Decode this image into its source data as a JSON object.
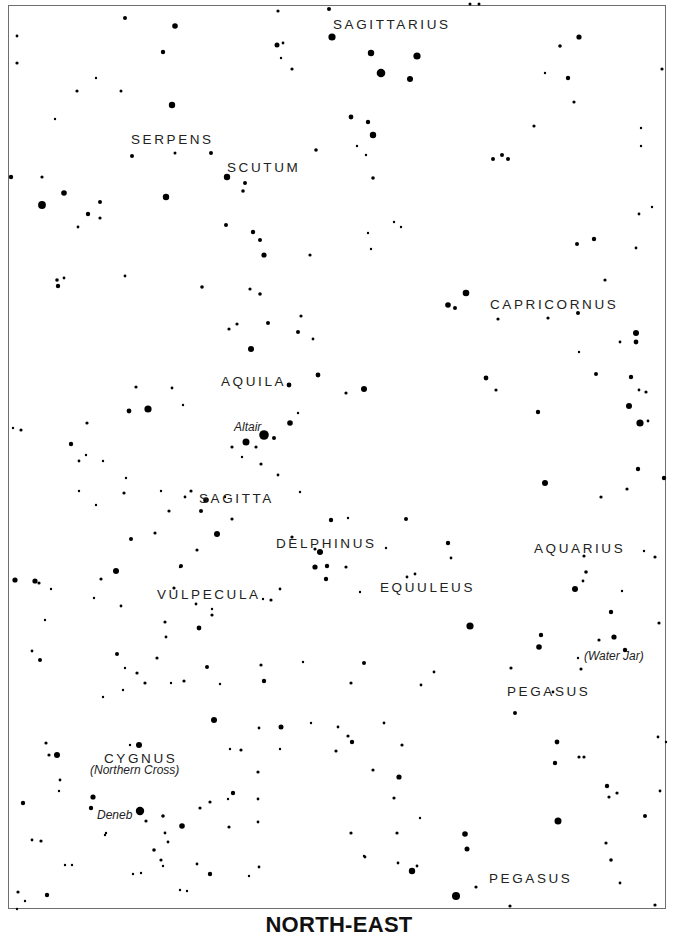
{
  "map": {
    "title": "NORTH-EAST",
    "frame": {
      "x": 8,
      "y": 5,
      "w": 658,
      "h": 904,
      "color": "#6e6e6e"
    },
    "colors": {
      "star": "#000000",
      "label": "#222222",
      "background": "#ffffff"
    },
    "constellation_labels": [
      {
        "text": "SAGITTARIUS",
        "x": 333,
        "y": 29
      },
      {
        "text": "SERPENS",
        "x": 131,
        "y": 144
      },
      {
        "text": "SCUTUM",
        "x": 227,
        "y": 172
      },
      {
        "text": "CAPRICORNUS",
        "x": 490,
        "y": 309
      },
      {
        "text": "AQUILA",
        "x": 221,
        "y": 386
      },
      {
        "text": "SAGITTA",
        "x": 199,
        "y": 503
      },
      {
        "text": "DELPHINUS",
        "x": 276,
        "y": 548
      },
      {
        "text": "AQUARIUS",
        "x": 534,
        "y": 553
      },
      {
        "text": "VULPECULA",
        "x": 157,
        "y": 599
      },
      {
        "text": "EQUULEUS",
        "x": 380,
        "y": 592
      },
      {
        "text": "PEGASUS",
        "x": 507,
        "y": 696
      },
      {
        "text": "CYGNUS",
        "x": 104,
        "y": 763
      },
      {
        "text": "PEGASUS",
        "x": 489,
        "y": 883
      }
    ],
    "star_labels": [
      {
        "text": "Altair",
        "x": 234,
        "y": 431
      },
      {
        "text": "(Water Jar)",
        "x": 584,
        "y": 660
      },
      {
        "text": "(Northern Cross)",
        "x": 90,
        "y": 774
      },
      {
        "text": "Deneb",
        "x": 97,
        "y": 819
      }
    ],
    "stars": [
      [
        332,
        37,
        3.6
      ],
      [
        371,
        53,
        3.2
      ],
      [
        417,
        56,
        3.6
      ],
      [
        381,
        73,
        4.3
      ],
      [
        410,
        79,
        3.0
      ],
      [
        351,
        117,
        2.4
      ],
      [
        368,
        122,
        2.2
      ],
      [
        373,
        135,
        3.2
      ],
      [
        366,
        155,
        1.2
      ],
      [
        373,
        178,
        1.8
      ],
      [
        357,
        146,
        1.2
      ],
      [
        125,
        18,
        2.0
      ],
      [
        175,
        26,
        2.8
      ],
      [
        163,
        52,
        2.2
      ],
      [
        172,
        105,
        3.2
      ],
      [
        121,
        91,
        1.5
      ],
      [
        17,
        63,
        1.6
      ],
      [
        17,
        36,
        1.4
      ],
      [
        77,
        91,
        1.6
      ],
      [
        96,
        78,
        1.2
      ],
      [
        55,
        119,
        1.2
      ],
      [
        42,
        177,
        1.6
      ],
      [
        11,
        177,
        2.2
      ],
      [
        42,
        205,
        3.9
      ],
      [
        64,
        193,
        2.8
      ],
      [
        88,
        214,
        2.2
      ],
      [
        100,
        202,
        2.0
      ],
      [
        100,
        218,
        1.6
      ],
      [
        78,
        227,
        1.4
      ],
      [
        166,
        197,
        3.2
      ],
      [
        175,
        153,
        1.5
      ],
      [
        132,
        156,
        2.0
      ],
      [
        211,
        153,
        2.0
      ],
      [
        227,
        177,
        3.2
      ],
      [
        245,
        183,
        2.0
      ],
      [
        243,
        191,
        1.8
      ],
      [
        226,
        225,
        2.0
      ],
      [
        253,
        232,
        2.2
      ],
      [
        260,
        240,
        2.0
      ],
      [
        264,
        255,
        2.6
      ],
      [
        278,
        11,
        1.6
      ],
      [
        292,
        69,
        1.6
      ],
      [
        277,
        45,
        2.5
      ],
      [
        283,
        43,
        1.4
      ],
      [
        281,
        58,
        1.2
      ],
      [
        316,
        150,
        1.8
      ],
      [
        329,
        9,
        2.0
      ],
      [
        470,
        4,
        1.5
      ],
      [
        479,
        4,
        1.5
      ],
      [
        579,
        37,
        2.6
      ],
      [
        560,
        46,
        1.8
      ],
      [
        568,
        78,
        2.2
      ],
      [
        574,
        102,
        1.6
      ],
      [
        545,
        73,
        1.2
      ],
      [
        502,
        155,
        2.0
      ],
      [
        493,
        159,
        2.0
      ],
      [
        508,
        159,
        2.0
      ],
      [
        534,
        126,
        1.6
      ],
      [
        662,
        69,
        1.6
      ],
      [
        641,
        128,
        1.2
      ],
      [
        641,
        146,
        1.2
      ],
      [
        394,
        222,
        1.2
      ],
      [
        401,
        227,
        1.2
      ],
      [
        368,
        233,
        1.2
      ],
      [
        371,
        249,
        1.2
      ],
      [
        577,
        244,
        2.0
      ],
      [
        594,
        239,
        2.2
      ],
      [
        639,
        214,
        1.4
      ],
      [
        652,
        207,
        1.2
      ],
      [
        636,
        248,
        1.4
      ],
      [
        466,
        293,
        3.3
      ],
      [
        448,
        305,
        2.8
      ],
      [
        455,
        308,
        2.0
      ],
      [
        498,
        319,
        1.6
      ],
      [
        548,
        318,
        1.6
      ],
      [
        578,
        313,
        2.0
      ],
      [
        605,
        280,
        1.6
      ],
      [
        636,
        333,
        3.0
      ],
      [
        636,
        342,
        2.4
      ],
      [
        620,
        342,
        1.4
      ],
      [
        579,
        352,
        1.2
      ],
      [
        486,
        378,
        2.4
      ],
      [
        496,
        390,
        1.6
      ],
      [
        538,
        412,
        2.2
      ],
      [
        596,
        374,
        2.0
      ],
      [
        631,
        377,
        2.2
      ],
      [
        639,
        390,
        1.4
      ],
      [
        629,
        406,
        3.0
      ],
      [
        640,
        423,
        3.6
      ],
      [
        646,
        392,
        1.6
      ],
      [
        648,
        421,
        1.4
      ],
      [
        545,
        483,
        3.0
      ],
      [
        638,
        469,
        2.2
      ],
      [
        627,
        489,
        1.6
      ],
      [
        664,
        478,
        2.2
      ],
      [
        364,
        389,
        3.0
      ],
      [
        346,
        393,
        1.6
      ],
      [
        318,
        375,
        2.4
      ],
      [
        298,
        332,
        2.0
      ],
      [
        301,
        316,
        1.6
      ],
      [
        251,
        349,
        3.0
      ],
      [
        229,
        329,
        1.6
      ],
      [
        237,
        324,
        1.6
      ],
      [
        268,
        323,
        2.0
      ],
      [
        289,
        385,
        2.4
      ],
      [
        264,
        435,
        4.8
      ],
      [
        246,
        442,
        3.5
      ],
      [
        274,
        438,
        2.0
      ],
      [
        290,
        423,
        2.8
      ],
      [
        256,
        447,
        1.6
      ],
      [
        232,
        447,
        1.6
      ],
      [
        261,
        464,
        1.6
      ],
      [
        242,
        457,
        1.2
      ],
      [
        148,
        409,
        3.6
      ],
      [
        129,
        411,
        2.4
      ],
      [
        183,
        405,
        1.2
      ],
      [
        136,
        387,
        1.6
      ],
      [
        172,
        388,
        1.4
      ],
      [
        21,
        430,
        1.6
      ],
      [
        13,
        428,
        1.2
      ],
      [
        71,
        444,
        2.2
      ],
      [
        87,
        423,
        1.6
      ],
      [
        79,
        461,
        1.4
      ],
      [
        57,
        280,
        1.8
      ],
      [
        64,
        278,
        1.4
      ],
      [
        58,
        286,
        2.2
      ],
      [
        125,
        276,
        1.4
      ],
      [
        202,
        287,
        1.8
      ],
      [
        260,
        294,
        1.8
      ],
      [
        313,
        339,
        1.4
      ],
      [
        310,
        255,
        1.6
      ],
      [
        250,
        289,
        1.6
      ],
      [
        278,
        475,
        1.4
      ],
      [
        300,
        492,
        1.2
      ],
      [
        298,
        413,
        1.2
      ],
      [
        191,
        491,
        1.6
      ],
      [
        185,
        497,
        1.4
      ],
      [
        206,
        500,
        2.8
      ],
      [
        201,
        511,
        2.0
      ],
      [
        217,
        534,
        3.0
      ],
      [
        232,
        519,
        1.6
      ],
      [
        225,
        497,
        1.2
      ],
      [
        169,
        511,
        1.6
      ],
      [
        124,
        493,
        1.6
      ],
      [
        131,
        539,
        2.0
      ],
      [
        155,
        533,
        1.6
      ],
      [
        197,
        550,
        1.6
      ],
      [
        181,
        566,
        2.0
      ],
      [
        174,
        588,
        1.6
      ],
      [
        180,
        567,
        1.2
      ],
      [
        161,
        491,
        1.2
      ],
      [
        126,
        478,
        1.2
      ],
      [
        116,
        571,
        3.0
      ],
      [
        101,
        579,
        1.6
      ],
      [
        35,
        581,
        2.6
      ],
      [
        15,
        580,
        2.6
      ],
      [
        39,
        583,
        1.6
      ],
      [
        51,
        589,
        1.2
      ],
      [
        331,
        520,
        2.2
      ],
      [
        320,
        552,
        3.0
      ],
      [
        315,
        549,
        1.6
      ],
      [
        315,
        567,
        2.6
      ],
      [
        327,
        566,
        2.2
      ],
      [
        326,
        579,
        2.2
      ],
      [
        280,
        589,
        1.4
      ],
      [
        271,
        600,
        1.6
      ],
      [
        263,
        599,
        1.2
      ],
      [
        196,
        604,
        1.4
      ],
      [
        212,
        615,
        1.6
      ],
      [
        212,
        609,
        1.2
      ],
      [
        199,
        628,
        2.4
      ],
      [
        165,
        622,
        1.6
      ],
      [
        117,
        654,
        2.0
      ],
      [
        125,
        668,
        1.2
      ],
      [
        94,
        598,
        1.2
      ],
      [
        121,
        606,
        1.4
      ],
      [
        292,
        537,
        1.6
      ],
      [
        348,
        518,
        1.2
      ],
      [
        346,
        567,
        1.6
      ],
      [
        406,
        519,
        2.0
      ],
      [
        386,
        548,
        1.2
      ],
      [
        407,
        577,
        1.4
      ],
      [
        415,
        574,
        1.4
      ],
      [
        448,
        543,
        2.2
      ],
      [
        451,
        558,
        1.4
      ],
      [
        470,
        626,
        3.6
      ],
      [
        360,
        592,
        1.2
      ],
      [
        541,
        635,
        2.2
      ],
      [
        539,
        647,
        2.8
      ],
      [
        611,
        612,
        2.2
      ],
      [
        614,
        637,
        2.6
      ],
      [
        599,
        640,
        1.6
      ],
      [
        625,
        650,
        2.2
      ],
      [
        581,
        669,
        1.6
      ],
      [
        578,
        658,
        1.2
      ],
      [
        601,
        497,
        1.6
      ],
      [
        586,
        572,
        1.8
      ],
      [
        575,
        589,
        3.0
      ],
      [
        584,
        556,
        1.6
      ],
      [
        583,
        581,
        1.4
      ],
      [
        622,
        591,
        1.2
      ],
      [
        655,
        557,
        1.6
      ],
      [
        644,
        551,
        1.2
      ],
      [
        659,
        623,
        1.6
      ],
      [
        511,
        668,
        1.6
      ],
      [
        553,
        692,
        1.4
      ],
      [
        515,
        713,
        2.0
      ],
      [
        557,
        742,
        2.4
      ],
      [
        555,
        763,
        2.2
      ],
      [
        579,
        757,
        1.6
      ],
      [
        584,
        757,
        1.6
      ],
      [
        607,
        786,
        2.2
      ],
      [
        609,
        797,
        1.6
      ],
      [
        617,
        793,
        1.6
      ],
      [
        558,
        821,
        3.5
      ],
      [
        606,
        843,
        1.6
      ],
      [
        611,
        860,
        1.8
      ],
      [
        658,
        737,
        1.4
      ],
      [
        645,
        816,
        2.0
      ],
      [
        666,
        742,
        1.2
      ],
      [
        660,
        791,
        1.4
      ],
      [
        620,
        883,
        1.4
      ],
      [
        655,
        905,
        1.6
      ],
      [
        40,
        660,
        2.0
      ],
      [
        32,
        651,
        1.4
      ],
      [
        45,
        620,
        1.2
      ],
      [
        96,
        505,
        1.2
      ],
      [
        103,
        461,
        1.2
      ],
      [
        86,
        455,
        1.2
      ],
      [
        79,
        491,
        1.2
      ],
      [
        157,
        658,
        1.6
      ],
      [
        137,
        673,
        1.6
      ],
      [
        145,
        683,
        1.6
      ],
      [
        103,
        697,
        1.2
      ],
      [
        123,
        690,
        1.2
      ],
      [
        171,
        683,
        1.2
      ],
      [
        184,
        681,
        1.6
      ],
      [
        207,
        667,
        2.0
      ],
      [
        166,
        637,
        1.4
      ],
      [
        220,
        684,
        1.2
      ],
      [
        214,
        720,
        3.0
      ],
      [
        241,
        750,
        1.6
      ],
      [
        281,
        727,
        2.5
      ],
      [
        259,
        728,
        1.4
      ],
      [
        230,
        749,
        1.2
      ],
      [
        280,
        749,
        1.2
      ],
      [
        261,
        665,
        1.6
      ],
      [
        303,
        662,
        1.2
      ],
      [
        364,
        663,
        2.0
      ],
      [
        264,
        681,
        2.2
      ],
      [
        351,
        683,
        1.6
      ],
      [
        336,
        751,
        1.6
      ],
      [
        373,
        770,
        1.6
      ],
      [
        399,
        777,
        2.6
      ],
      [
        394,
        798,
        1.6
      ],
      [
        311,
        723,
        1.2
      ],
      [
        384,
        723,
        1.4
      ],
      [
        421,
        685,
        1.4
      ],
      [
        434,
        672,
        1.4
      ],
      [
        338,
        727,
        1.4
      ],
      [
        139,
        745,
        3.0
      ],
      [
        130,
        745,
        1.2
      ],
      [
        57,
        755,
        3.0
      ],
      [
        49,
        755,
        1.6
      ],
      [
        46,
        743,
        1.6
      ],
      [
        60,
        780,
        1.4
      ],
      [
        59,
        791,
        1.2
      ],
      [
        23,
        803,
        2.2
      ],
      [
        93,
        797,
        2.6
      ],
      [
        91,
        808,
        2.2
      ],
      [
        140,
        811,
        4.2
      ],
      [
        146,
        821,
        1.6
      ],
      [
        163,
        816,
        1.8
      ],
      [
        182,
        826,
        2.8
      ],
      [
        165,
        833,
        1.4
      ],
      [
        168,
        842,
        1.4
      ],
      [
        154,
        850,
        1.8
      ],
      [
        106,
        833,
        1.2
      ],
      [
        105,
        835,
        1.2
      ],
      [
        41,
        841,
        1.6
      ],
      [
        32,
        840,
        1.4
      ],
      [
        161,
        860,
        1.6
      ],
      [
        200,
        808,
        1.6
      ],
      [
        229,
        827,
        1.6
      ],
      [
        233,
        793,
        2.2
      ],
      [
        210,
        802,
        1.6
      ],
      [
        228,
        799,
        1.2
      ],
      [
        258,
        772,
        1.6
      ],
      [
        258,
        799,
        1.4
      ],
      [
        258,
        822,
        1.4
      ],
      [
        259,
        867,
        1.4
      ],
      [
        249,
        876,
        1.2
      ],
      [
        210,
        874,
        2.2
      ],
      [
        197,
        864,
        1.4
      ],
      [
        163,
        866,
        1.2
      ],
      [
        141,
        873,
        1.2
      ],
      [
        133,
        874,
        1.2
      ],
      [
        187,
        891,
        1.2
      ],
      [
        180,
        890,
        1.2
      ],
      [
        47,
        895,
        2.2
      ],
      [
        18,
        892,
        1.6
      ],
      [
        17,
        909,
        1.2
      ],
      [
        25,
        901,
        1.2
      ],
      [
        72,
        865,
        1.2
      ],
      [
        65,
        865,
        1.2
      ],
      [
        352,
        742,
        2.2
      ],
      [
        348,
        736,
        1.6
      ],
      [
        420,
        818,
        1.2
      ],
      [
        351,
        833,
        1.6
      ],
      [
        397,
        833,
        1.6
      ],
      [
        365,
        857,
        1.4
      ],
      [
        398,
        863,
        1.4
      ],
      [
        412,
        871,
        3.2
      ],
      [
        417,
        866,
        1.4
      ],
      [
        465,
        834,
        2.8
      ],
      [
        467,
        849,
        2.5
      ],
      [
        456,
        896,
        4.0
      ],
      [
        476,
        887,
        1.6
      ],
      [
        510,
        906,
        1.6
      ],
      [
        364,
        856,
        1.2
      ],
      [
        402,
        745,
        1.6
      ]
    ]
  }
}
